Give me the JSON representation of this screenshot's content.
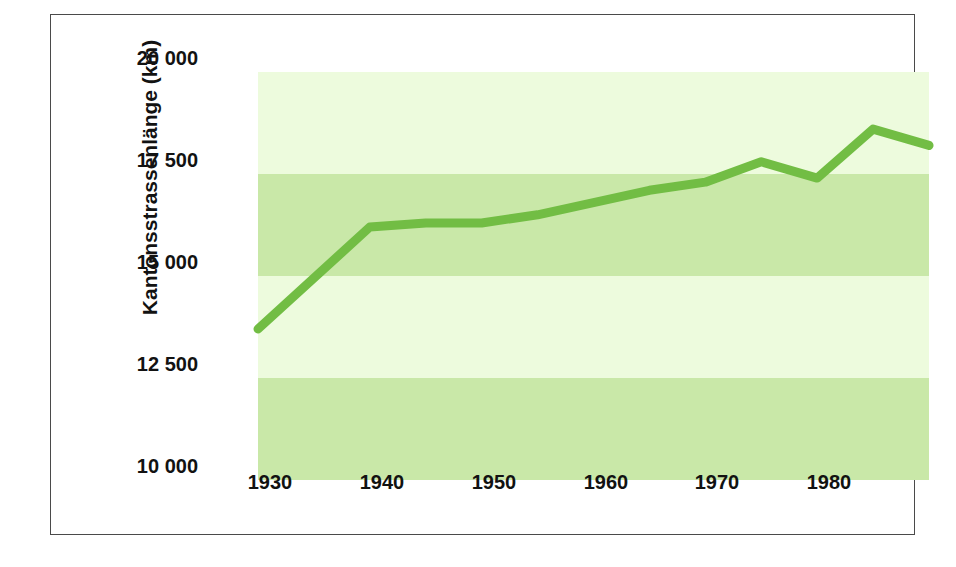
{
  "chart_data": {
    "type": "line",
    "title": "",
    "xlabel": "",
    "ylabel": "Kantonsstrassenlänge (km)",
    "x": [
      1925,
      1935,
      1940,
      1945,
      1950,
      1955,
      1960,
      1965,
      1970,
      1975,
      1980,
      1985
    ],
    "values": [
      13700,
      16200,
      16300,
      16300,
      16500,
      16800,
      17100,
      17300,
      17800,
      17400,
      18600,
      18200
    ],
    "series": [
      {
        "name": "Kantonsstrassenlänge",
        "values": [
          13700,
          16200,
          16300,
          16300,
          16500,
          16800,
          17100,
          17300,
          17800,
          17400,
          18600,
          18200
        ]
      }
    ],
    "xlim": [
      1925,
      1985
    ],
    "ylim": [
      10000,
      20000
    ],
    "x_tick_values": [
      1930,
      1940,
      1950,
      1960,
      1970,
      1980
    ],
    "x_tick_labels": [
      "1930",
      "1940",
      "1950",
      "1960",
      "1970",
      "1980"
    ],
    "y_tick_values": [
      20000,
      17500,
      15000,
      12500,
      10000
    ],
    "y_tick_labels": [
      "20 000",
      "17 500",
      "15 000",
      "12 500",
      "10 000"
    ],
    "grid": false,
    "legend": "none",
    "line_color": "#72bd44",
    "band_color_light": "#edfbdd",
    "band_color_medium": "#c9e8a8",
    "bands": [
      {
        "from": 20000,
        "to": 17500,
        "shade": "light"
      },
      {
        "from": 17500,
        "to": 15000,
        "shade": "medium"
      },
      {
        "from": 15000,
        "to": 12500,
        "shade": "light"
      },
      {
        "from": 12500,
        "to": 10000,
        "shade": "medium"
      }
    ]
  },
  "axis": {
    "y_title": "Kantonsstrassenlänge (km)",
    "y_ticks": [
      {
        "label": "20 000",
        "value": 20000
      },
      {
        "label": "17 500",
        "value": 17500
      },
      {
        "label": "15 000",
        "value": 15000
      },
      {
        "label": "12 500",
        "value": 12500
      },
      {
        "label": "10 000",
        "value": 10000
      }
    ],
    "x_ticks": [
      {
        "label": "1930",
        "value": 1930
      },
      {
        "label": "1940",
        "value": 1940
      },
      {
        "label": "1950",
        "value": 1950
      },
      {
        "label": "1960",
        "value": 1960
      },
      {
        "label": "1970",
        "value": 1970
      },
      {
        "label": "1980",
        "value": 1980
      }
    ]
  },
  "style": {
    "frame_color": "#4a4a4a",
    "text_color": "#121212",
    "background": "#ffffff"
  }
}
